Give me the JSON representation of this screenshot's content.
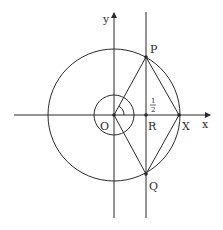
{
  "diagram": {
    "type": "unit-circle-geometry",
    "labels": {
      "y_axis": "y",
      "x_axis": "x",
      "origin": "O",
      "point_p": "P",
      "point_q": "Q",
      "point_r": "R",
      "point_x": "X",
      "half_num": "1",
      "half_den": "2"
    },
    "colors": {
      "stroke": "#2a2a2a",
      "background": "#ffffff"
    }
  }
}
